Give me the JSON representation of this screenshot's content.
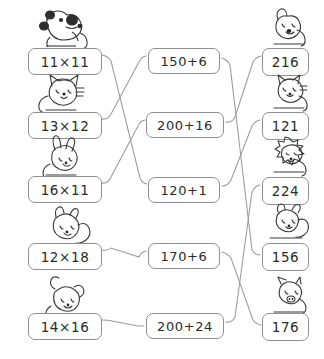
{
  "worksheet": {
    "type": "matching-exercise",
    "title": "",
    "columns": {
      "left_label": "multiplication expressions",
      "middle_label": "addition expressions",
      "right_label": "answers"
    },
    "ink_color": "#8f9094",
    "text_color": "#2b2b2b",
    "background": "#ffffff"
  },
  "left_column": [
    {
      "id": "L1",
      "text": "11×11",
      "animal": "dog-with-spots",
      "x": 28,
      "y": 48
    },
    {
      "id": "L2",
      "text": "13×12",
      "animal": "cat",
      "x": 28,
      "y": 112
    },
    {
      "id": "L3",
      "text": "16×11",
      "animal": "rabbit",
      "x": 28,
      "y": 176
    },
    {
      "id": "L4",
      "text": "12×18",
      "animal": "squirrel",
      "x": 28,
      "y": 243
    },
    {
      "id": "L5",
      "text": "14×16",
      "animal": "mouse",
      "x": 28,
      "y": 313
    }
  ],
  "middle_column": [
    {
      "id": "M1",
      "text": "150+6",
      "x": 148,
      "y": 48
    },
    {
      "id": "M2",
      "text": "200+16",
      "x": 146,
      "y": 112
    },
    {
      "id": "M3",
      "text": "120+1",
      "x": 148,
      "y": 177
    },
    {
      "id": "M4",
      "text": "170+6",
      "x": 148,
      "y": 243
    },
    {
      "id": "M5",
      "text": "200+24",
      "x": 146,
      "y": 313
    }
  ],
  "right_column": [
    {
      "id": "R1",
      "text": "216",
      "animal": "dog",
      "x": 262,
      "y": 48
    },
    {
      "id": "R2",
      "text": "121",
      "animal": "cat",
      "x": 262,
      "y": 112
    },
    {
      "id": "R3",
      "text": "224",
      "animal": "lion",
      "x": 262,
      "y": 177
    },
    {
      "id": "R4",
      "text": "156",
      "animal": "squirrel",
      "x": 262,
      "y": 243
    },
    {
      "id": "R5",
      "text": "176",
      "animal": "pig",
      "x": 262,
      "y": 313
    }
  ],
  "connections": [
    {
      "from": "L1",
      "to": "M3"
    },
    {
      "from": "L2",
      "to": "M1"
    },
    {
      "from": "L3",
      "to": "M2"
    },
    {
      "from": "L4",
      "to": "M4"
    },
    {
      "from": "L5",
      "to": "M5"
    },
    {
      "from": "M1",
      "to": "R4"
    },
    {
      "from": "M2",
      "to": "R1"
    },
    {
      "from": "M3",
      "to": "R2"
    },
    {
      "from": "M4",
      "to": "R5"
    },
    {
      "from": "M5",
      "to": "R3"
    }
  ]
}
